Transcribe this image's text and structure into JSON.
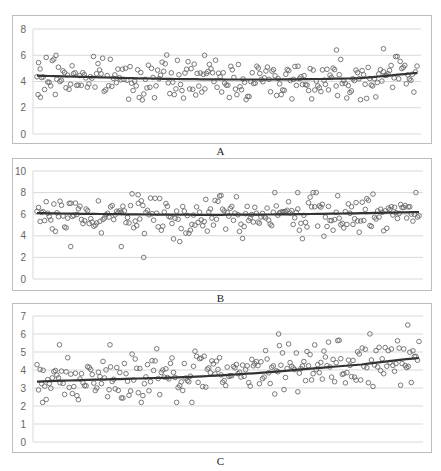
{
  "chart_data": [
    {
      "type": "scatter",
      "panel_label": "A",
      "title": "",
      "xlabel": "",
      "ylabel": "",
      "ylim": [
        0,
        8
      ],
      "yticks": [
        0,
        2,
        4,
        6,
        8
      ],
      "grid": true,
      "legend": "none",
      "n_points": 250,
      "point_range": [
        2.6,
        6.5
      ],
      "trend": {
        "type": "polynomial",
        "start": 4.5,
        "min": 4.2,
        "mid": 4.3,
        "end": 4.5
      },
      "notable_points": [
        [
          1,
          3.0
        ],
        [
          3,
          2.8
        ],
        [
          17,
          6.0
        ],
        [
          150,
          6.0
        ],
        [
          268,
          6.4
        ],
        [
          310,
          6.5
        ]
      ],
      "series": [
        {
          "name": "A",
          "marker": "open-circle",
          "color": "#666666"
        }
      ]
    },
    {
      "type": "scatter",
      "panel_label": "B",
      "title": "",
      "xlabel": "",
      "ylabel": "",
      "ylim": [
        0,
        10
      ],
      "yticks": [
        0,
        2,
        4,
        6,
        8,
        10
      ],
      "grid": true,
      "legend": "none",
      "n_points": 250,
      "point_range": [
        2.0,
        8.0
      ],
      "trend": {
        "type": "polynomial",
        "start": 6.1,
        "mid": 5.9,
        "end": 6.0
      },
      "notable_points": [
        [
          30,
          3.0
        ],
        [
          75,
          3.0
        ],
        [
          95,
          2.0
        ],
        [
          232,
          8.0
        ],
        [
          90,
          7.8
        ]
      ],
      "series": [
        {
          "name": "B",
          "marker": "open-circle",
          "color": "#666666"
        }
      ]
    },
    {
      "type": "scatter",
      "panel_label": "C",
      "title": "",
      "xlabel": "",
      "ylabel": "",
      "ylim": [
        0,
        7
      ],
      "yticks": [
        0,
        1,
        2,
        3,
        4,
        5,
        6,
        7
      ],
      "grid": true,
      "legend": "none",
      "n_points": 250,
      "point_range": [
        2.2,
        6.5
      ],
      "trend": {
        "type": "polynomial",
        "start": 3.35,
        "mid": 3.9,
        "end": 4.2
      },
      "notable_points": [
        [
          5,
          2.2
        ],
        [
          20,
          5.4
        ],
        [
          65,
          5.4
        ],
        [
          215,
          6.0
        ],
        [
          330,
          6.5
        ]
      ],
      "series": [
        {
          "name": "C",
          "marker": "open-circle",
          "color": "#666666"
        }
      ]
    }
  ],
  "labels": {
    "a": "A",
    "b": "B",
    "c": "C"
  }
}
